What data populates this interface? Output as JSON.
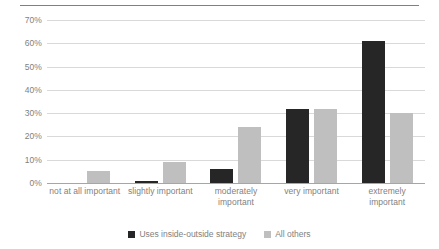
{
  "chart_data": {
    "type": "bar",
    "title": "",
    "xlabel": "",
    "ylabel": "",
    "categories": [
      "not at all important",
      "slightly important",
      "moderately important",
      "very important",
      "extremely important"
    ],
    "series": [
      {
        "name": "Uses inside-outside strategy",
        "color": "#262626",
        "values": [
          0,
          1,
          6,
          32,
          61
        ]
      },
      {
        "name": "All others",
        "color": "#bfbfbf",
        "values": [
          5,
          9,
          24,
          32,
          30
        ]
      }
    ],
    "ylim": [
      0,
      70
    ],
    "ytick_labels": [
      "70%",
      "60%",
      "50%",
      "40%",
      "30%",
      "20%",
      "10%",
      "0%"
    ],
    "ytick_values": [
      70,
      60,
      50,
      40,
      30,
      20,
      10,
      0
    ],
    "grid": true,
    "legend_position": "bottom",
    "value_suffix": "%"
  },
  "colors": {
    "series_dark": "#262626",
    "series_light": "#bfbfbf",
    "gridline": "#d9d9d9",
    "axis": "#a6a6a6",
    "text": "#7f7f7f"
  }
}
